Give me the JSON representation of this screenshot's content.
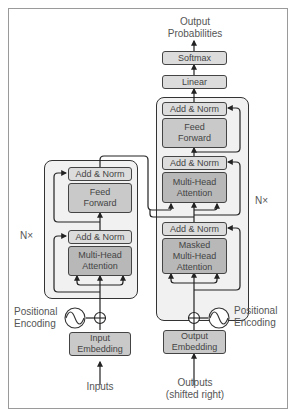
{
  "output": {
    "line1": "Output",
    "line2": "Probabilities"
  },
  "head": {
    "softmax": "Softmax",
    "linear": "Linear"
  },
  "decoder": {
    "repeat_label": "N×",
    "add_norm_top": "Add & Norm",
    "feed_forward": {
      "line1": "Feed",
      "line2": "Forward"
    },
    "add_norm_mid": "Add & Norm",
    "cross_attention": {
      "line1": "Multi-Head",
      "line2": "Attention"
    },
    "add_norm_bottom": "Add & Norm",
    "masked_attention": {
      "line1": "Masked",
      "line2": "Multi-Head",
      "line3": "Attention"
    },
    "embedding": {
      "line1": "Output",
      "line2": "Embedding"
    },
    "positional": {
      "line1": "Positional",
      "line2": "Encoding"
    },
    "input_label": {
      "line1": "Outputs",
      "line2": "(shifted right)"
    }
  },
  "encoder": {
    "repeat_label": "N×",
    "add_norm_top": "Add & Norm",
    "feed_forward": {
      "line1": "Feed",
      "line2": "Forward"
    },
    "add_norm_bottom": "Add & Norm",
    "attention": {
      "line1": "Multi-Head",
      "line2": "Attention"
    },
    "embedding": {
      "line1": "Input",
      "line2": "Embedding"
    },
    "positional": {
      "line1": "Positional",
      "line2": "Encoding"
    },
    "input_label": "Inputs"
  },
  "colors": {
    "border": "#444444",
    "outer_fill": "#f1f1f1",
    "add_norm_fill": "#dcdcdc",
    "block_fill": "#c9c9c9",
    "text": "#555555"
  }
}
